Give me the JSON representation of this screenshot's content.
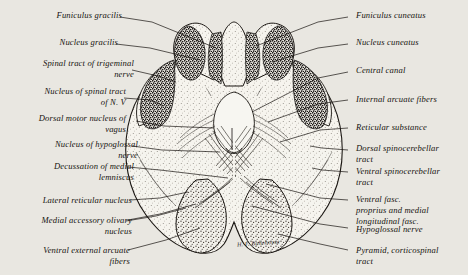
{
  "figure": {
    "signature": "H. F. Bohnhouse",
    "background_color": "#e9e7e1",
    "ink_color": "#16130f"
  },
  "labels_left": [
    {
      "id": "funiculus-gracilis",
      "text": "Funiculus gracilis"
    },
    {
      "id": "nucleus-gracilis",
      "text": "Nucleus gracilis"
    },
    {
      "id": "spinal-tract-trigeminal-nerve",
      "text": "Spinal tract of trigeminal\nnerve"
    },
    {
      "id": "nucleus-spinal-tract-n5",
      "text": "Nucleus of spinal tract\nof N. V"
    },
    {
      "id": "dorsal-motor-nucleus-vagus",
      "text": "Dorsal motor nucleus of\nvagus"
    },
    {
      "id": "nucleus-hypoglossal-nerve",
      "text": "Nucleus of hypoglossal\nnerve"
    },
    {
      "id": "decussation-medial-lemniscus",
      "text": "Decussation of medial\nlemniscus"
    },
    {
      "id": "lateral-reticular-nucleus",
      "text": "Lateral reticular nucleus"
    },
    {
      "id": "medial-accessory-olivary-nucleus",
      "text": "Medial accessory olivary\nnucleus"
    },
    {
      "id": "ventral-external-arcuate-fibers",
      "text": "Ventral external arcuate\nfibers"
    }
  ],
  "labels_right": [
    {
      "id": "funiculus-cuneatus",
      "text": "Funiculus cuneatus"
    },
    {
      "id": "nucleus-cuneatus",
      "text": "Nucleus cuneatus"
    },
    {
      "id": "central-canal",
      "text": "Central canal"
    },
    {
      "id": "internal-arcuate-fibers",
      "text": "Internal arcuate fibers"
    },
    {
      "id": "reticular-substance",
      "text": "Reticular substance"
    },
    {
      "id": "dorsal-spinocerebellar-tract",
      "text": "Dorsal spinocerebellar\ntract"
    },
    {
      "id": "ventral-spinocerebellar-tract",
      "text": "Ventral spinocerebellar\ntract"
    },
    {
      "id": "ventral-fasc-proprius",
      "text": "Ventral fasc.\n   proprius and medial\n   longitudinal fasc."
    },
    {
      "id": "hypoglossal-nerve",
      "text": "Hypoglossal nerve"
    },
    {
      "id": "pyramid-corticospinal-tract",
      "text": "Pyramid, corticospinal\ntract"
    }
  ]
}
